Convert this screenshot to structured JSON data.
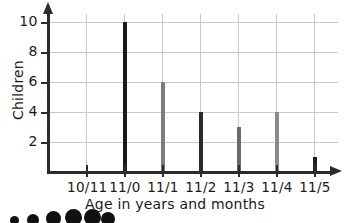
{
  "chart_data": {
    "type": "bar",
    "title": "",
    "xlabel": "Age in years and months",
    "ylabel": "Children",
    "categories": [
      "10/11",
      "11/0",
      "11/1",
      "11/2",
      "11/3",
      "11/4",
      "11/5"
    ],
    "values": [
      0,
      10,
      6,
      4,
      3,
      4,
      1
    ],
    "bar_colors": [
      "#1a1a1a",
      "#1a1a1a",
      "#7d7d7d",
      "#2b2b2b",
      "#6a6a6a",
      "#8a8a8a",
      "#1f1f1f"
    ],
    "ylim": [
      0,
      10
    ],
    "ytick_labels": [
      "2",
      "4",
      "6",
      "8",
      "10"
    ],
    "ytick_values": [
      2,
      4,
      6,
      8,
      10
    ],
    "grid": "both",
    "legend": "none",
    "axis_color": "#2b2b2b",
    "grid_color": "#c9c9c9"
  },
  "axes": {
    "y_arrow": "arrow-up-icon",
    "x_arrow": "arrow-right-icon"
  },
  "footer_artifact": {
    "name": "page-bullet-blobs",
    "count": 6
  }
}
